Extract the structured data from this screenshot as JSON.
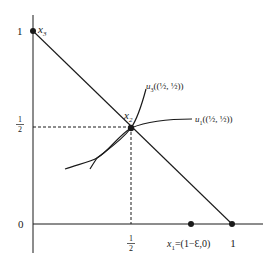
{
  "diagram": {
    "type": "edgeworth-simplex-indifference",
    "axes": {
      "y_ticks": [
        {
          "label": "1",
          "value": 1
        },
        {
          "label_num": "1",
          "label_den": "2",
          "value": 0.5
        },
        {
          "label": "0",
          "value": 0
        }
      ],
      "x_ticks": [
        {
          "label_num": "1",
          "label_den": "2",
          "value": 0.5
        },
        {
          "label": "1",
          "value": 1
        }
      ]
    },
    "points": {
      "x3": {
        "name": "x",
        "sub": "3",
        "coords": [
          0,
          1
        ]
      },
      "x2": {
        "name": "x",
        "sub": "2",
        "coords": [
          0.5,
          0.5
        ]
      },
      "x1": {
        "name": "x",
        "sub": "1",
        "label_rest": "=(1−Ɛ,0)",
        "coords": [
          "1-ε",
          0
        ]
      },
      "one_zero": {
        "coords": [
          1,
          0
        ]
      }
    },
    "curves": {
      "u3": {
        "name": "u",
        "sub": "3",
        "arg": "((½, ½))"
      },
      "u1": {
        "name": "u",
        "sub": "1",
        "arg": "((½, ½))"
      }
    },
    "colors": {
      "ink": "#1a1a1a",
      "background": "#ffffff"
    }
  }
}
